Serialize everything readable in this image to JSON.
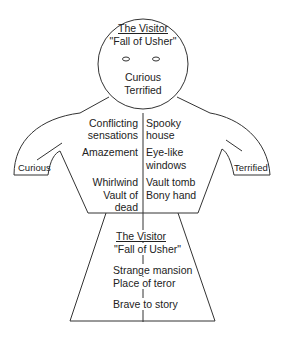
{
  "head": {
    "title": "The Visitor",
    "subtitle": "\"Fall of Usher\"",
    "feelings": [
      "Curious",
      "Terrified"
    ]
  },
  "left_hand": {
    "label": "Curious"
  },
  "right_hand": {
    "label": "Terrified"
  },
  "torso": {
    "left_column": [
      "Conflicting",
      "sensations",
      "Amazement",
      "Whirlwind",
      "Vault of",
      "dead"
    ],
    "right_column": [
      "Spooky",
      "house",
      "Eye-like",
      "windows",
      "Vault tomb",
      "Bony hand"
    ]
  },
  "skirt": {
    "title": "The Visitor",
    "subtitle": "\"Fall of Usher\"",
    "lines": [
      "Strange mansion",
      "Place of teror",
      "Brave to story"
    ]
  }
}
